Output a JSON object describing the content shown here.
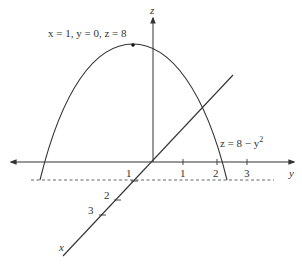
{
  "figure": {
    "point_label": "x = 1,  y = 0,  z = 8",
    "curve_label": "z = 8 − y",
    "curve_label_exp": "2",
    "axes": {
      "z_label": "z",
      "y_label": "y",
      "x_label": "x"
    },
    "y_ticks": [
      "1",
      "2",
      "3"
    ],
    "x_ticks": [
      "1",
      "2",
      "3"
    ],
    "colors": {
      "ink": "#333333",
      "background": "#ffffff"
    }
  }
}
